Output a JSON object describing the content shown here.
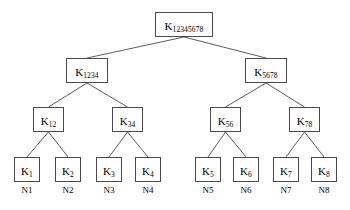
{
  "diagram": {
    "type": "binary-key-tree",
    "canvas": {
      "width": 350,
      "height": 210
    },
    "colors": {
      "background": "#ffffff",
      "box_border": "#4a4a4a",
      "edge_stroke": "#4a4a4a",
      "text": "#000000"
    },
    "levels": 4
  },
  "nodes": [
    {
      "id": "k12345678",
      "base": "K",
      "subscript": "12345678",
      "level": 0,
      "x": 155,
      "y": 12,
      "w": 58,
      "h": 25
    },
    {
      "id": "k1234",
      "base": "K",
      "subscript": "1234",
      "level": 1,
      "x": 66,
      "y": 58,
      "w": 42,
      "h": 25
    },
    {
      "id": "k5678",
      "base": "K",
      "subscript": "5678",
      "level": 1,
      "x": 245,
      "y": 58,
      "w": 42,
      "h": 25
    },
    {
      "id": "k12",
      "base": "K",
      "subscript": "12",
      "level": 2,
      "x": 33,
      "y": 107,
      "w": 31,
      "h": 25
    },
    {
      "id": "k34",
      "base": "K",
      "subscript": "34",
      "level": 2,
      "x": 112,
      "y": 107,
      "w": 31,
      "h": 25
    },
    {
      "id": "k56",
      "base": "K",
      "subscript": "56",
      "level": 2,
      "x": 210,
      "y": 107,
      "w": 31,
      "h": 25
    },
    {
      "id": "k78",
      "base": "K",
      "subscript": "78",
      "level": 2,
      "x": 289,
      "y": 107,
      "w": 31,
      "h": 25
    },
    {
      "id": "k1",
      "base": "K",
      "subscript": "1",
      "level": 3,
      "x": 14,
      "y": 157,
      "w": 26,
      "h": 25
    },
    {
      "id": "k2",
      "base": "K",
      "subscript": "2",
      "level": 3,
      "x": 55,
      "y": 157,
      "w": 26,
      "h": 25
    },
    {
      "id": "k3",
      "base": "K",
      "subscript": "3",
      "level": 3,
      "x": 96,
      "y": 157,
      "w": 26,
      "h": 25
    },
    {
      "id": "k4",
      "base": "K",
      "subscript": "4",
      "level": 3,
      "x": 135,
      "y": 157,
      "w": 26,
      "h": 25
    },
    {
      "id": "k5",
      "base": "K",
      "subscript": "5",
      "level": 3,
      "x": 195,
      "y": 157,
      "w": 26,
      "h": 25
    },
    {
      "id": "k6",
      "base": "K",
      "subscript": "6",
      "level": 3,
      "x": 233,
      "y": 157,
      "w": 26,
      "h": 25
    },
    {
      "id": "k7",
      "base": "K",
      "subscript": "7",
      "level": 3,
      "x": 273,
      "y": 157,
      "w": 26,
      "h": 25
    },
    {
      "id": "k8",
      "base": "K",
      "subscript": "8",
      "level": 3,
      "x": 311,
      "y": 157,
      "w": 26,
      "h": 25
    }
  ],
  "edges": [
    {
      "from": "k12345678",
      "to": "k1234"
    },
    {
      "from": "k12345678",
      "to": "k5678"
    },
    {
      "from": "k1234",
      "to": "k12"
    },
    {
      "from": "k1234",
      "to": "k34"
    },
    {
      "from": "k5678",
      "to": "k56"
    },
    {
      "from": "k5678",
      "to": "k78"
    },
    {
      "from": "k12",
      "to": "k1"
    },
    {
      "from": "k12",
      "to": "k2"
    },
    {
      "from": "k34",
      "to": "k3"
    },
    {
      "from": "k34",
      "to": "k4"
    },
    {
      "from": "k56",
      "to": "k5"
    },
    {
      "from": "k56",
      "to": "k6"
    },
    {
      "from": "k78",
      "to": "k7"
    },
    {
      "from": "k78",
      "to": "k8"
    }
  ],
  "members": [
    {
      "id": "n1",
      "label": "N1",
      "node": "k1",
      "x": 14,
      "y": 186,
      "w": 26
    },
    {
      "id": "n2",
      "label": "N2",
      "node": "k2",
      "x": 55,
      "y": 186,
      "w": 26
    },
    {
      "id": "n3",
      "label": "N3",
      "node": "k3",
      "x": 96,
      "y": 186,
      "w": 26
    },
    {
      "id": "n4",
      "label": "N4",
      "node": "k4",
      "x": 135,
      "y": 186,
      "w": 26
    },
    {
      "id": "n5",
      "label": "N5",
      "node": "k5",
      "x": 195,
      "y": 186,
      "w": 26
    },
    {
      "id": "n6",
      "label": "N6",
      "node": "k6",
      "x": 233,
      "y": 186,
      "w": 26
    },
    {
      "id": "n7",
      "label": "N7",
      "node": "k7",
      "x": 273,
      "y": 186,
      "w": 26
    },
    {
      "id": "n8",
      "label": "N8",
      "node": "k8",
      "x": 311,
      "y": 186,
      "w": 26
    }
  ]
}
